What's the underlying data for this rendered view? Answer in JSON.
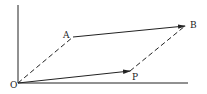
{
  "diagram": {
    "type": "vector-parallelogram",
    "colors": {
      "line": "#222222",
      "background": "#ffffff"
    },
    "axes": {
      "origin": {
        "label": "O",
        "x": 18,
        "y": 83
      },
      "vertical_top_y": 5,
      "horizontal_right_x": 188
    },
    "points": {
      "O": {
        "label": "O",
        "x": 18,
        "y": 83,
        "label_x": 10,
        "label_y": 88
      },
      "A": {
        "label": "A",
        "x": 73,
        "y": 37,
        "label_x": 63,
        "label_y": 38
      },
      "B": {
        "label": "B",
        "x": 185,
        "y": 26,
        "label_x": 190,
        "label_y": 28
      },
      "P": {
        "label": "P",
        "x": 130,
        "y": 71,
        "label_x": 132,
        "label_y": 80
      }
    },
    "segments": [
      {
        "from": "O",
        "to": "P",
        "style": "solid",
        "arrow": true
      },
      {
        "from": "A",
        "to": "B",
        "style": "solid",
        "arrow": true
      },
      {
        "from": "O",
        "to": "A",
        "style": "dashed",
        "arrow": false
      },
      {
        "from": "P",
        "to": "B",
        "style": "dashed",
        "arrow": false
      }
    ]
  }
}
